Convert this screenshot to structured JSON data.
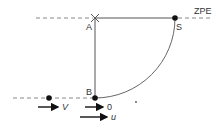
{
  "diagram": {
    "labels": {
      "A": "A",
      "S": "S",
      "B": "B",
      "zpe": "ZPE",
      "V": "V",
      "zero": "0",
      "u": "u"
    },
    "colors": {
      "line": "#555555",
      "dashed": "#888888",
      "dot": "#111111",
      "text": "#333333"
    }
  }
}
